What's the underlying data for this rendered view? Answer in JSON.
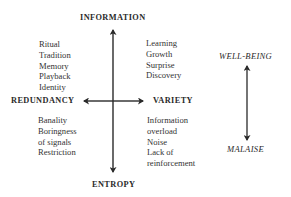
{
  "diagram": {
    "axes": {
      "top": "INFORMATION",
      "bottom": "ENTROPY",
      "left": "REDUNDANCY",
      "right": "VARIETY"
    },
    "scale": {
      "top": "WELL-BEING",
      "bottom": "MALAISE"
    },
    "quadrants": {
      "top_left": [
        "Ritual",
        "Tradition",
        "Memory",
        "Playback",
        "Identity"
      ],
      "top_right": [
        "Learning",
        "Growth",
        "Surprise",
        "Discovery"
      ],
      "bottom_left": [
        "Banality",
        "Boringness",
        "of signals",
        "Restriction"
      ],
      "bottom_right": [
        "Information",
        "overload",
        "Noise",
        "Lack of",
        "reinforcement"
      ]
    },
    "colors": {
      "ink": "#2a2a2a",
      "background": "#ffffff"
    }
  }
}
